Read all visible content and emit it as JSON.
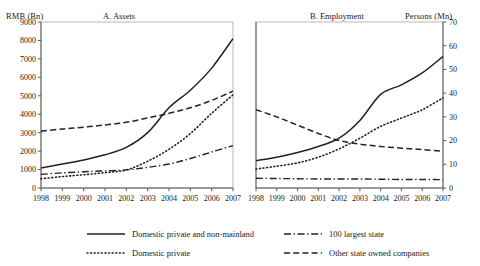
{
  "figure": {
    "background": "#ffffff",
    "line_color": "#222222"
  },
  "panels": [
    {
      "id": "assets",
      "title": "A. Assets",
      "unit_label": "RMB (Bn)",
      "unit_position": "left"
    },
    {
      "id": "employment",
      "title": "B. Employment",
      "unit_label": "Persons (Mn)",
      "unit_position": "right"
    }
  ],
  "legend": {
    "items": [
      {
        "label": "Domestic private and non-mainland",
        "style": "solid"
      },
      {
        "label": "Domestic private",
        "style": "dotted"
      },
      {
        "label": "100 largest state",
        "style": "dashdot"
      },
      {
        "label": "Other state owned companies",
        "style": "dashed"
      }
    ]
  },
  "chart_data": [
    {
      "type": "line",
      "title": "A. Assets",
      "xlabel": "",
      "ylabel": "RMB (Bn)",
      "grid": false,
      "legend_position": "below-figure",
      "x": [
        1998,
        1999,
        2000,
        2001,
        2002,
        2003,
        2004,
        2005,
        2006,
        2007
      ],
      "xtick_labels": [
        "1998",
        "1999",
        "2000",
        "2001",
        "2002",
        "2003",
        "2004",
        "2005",
        "2006",
        "2007"
      ],
      "ylim": [
        0,
        9000
      ],
      "ytick_labels": [
        "0",
        "1000",
        "2000",
        "3000",
        "4000",
        "5000",
        "6000",
        "7000",
        "8000",
        "9000"
      ],
      "yticks": [
        0,
        1000,
        2000,
        3000,
        4000,
        5000,
        6000,
        7000,
        8000,
        9000
      ],
      "series": [
        {
          "name": "Domestic private and non-mainland",
          "style": "solid",
          "values": [
            1080,
            1300,
            1520,
            1800,
            2200,
            3000,
            4350,
            5300,
            6500,
            8100
          ]
        },
        {
          "name": "Domestic private",
          "style": "dotted",
          "values": [
            500,
            620,
            720,
            830,
            980,
            1450,
            2100,
            2950,
            4050,
            5050
          ]
        },
        {
          "name": "100 largest state",
          "style": "dashdot",
          "values": [
            740,
            820,
            880,
            930,
            980,
            1120,
            1300,
            1600,
            1950,
            2300
          ]
        },
        {
          "name": "Other state owned companies",
          "style": "dashed",
          "values": [
            3080,
            3200,
            3300,
            3420,
            3560,
            3800,
            4050,
            4350,
            4750,
            5250
          ]
        }
      ]
    },
    {
      "type": "line",
      "title": "B. Employment",
      "xlabel": "",
      "ylabel": "Persons (Mn)",
      "grid": false,
      "legend_position": "below-figure",
      "x": [
        1998,
        1999,
        2000,
        2001,
        2002,
        2003,
        2004,
        2005,
        2006,
        2007
      ],
      "xtick_labels": [
        "1998",
        "1999",
        "2000",
        "2001",
        "2002",
        "2003",
        "2004",
        "2005",
        "2006",
        "2007"
      ],
      "ylim": [
        0,
        70
      ],
      "ytick_labels": [
        "0",
        "10",
        "20",
        "30",
        "40",
        "50",
        "60",
        "70"
      ],
      "yticks": [
        0,
        10,
        20,
        30,
        40,
        50,
        60,
        70
      ],
      "series": [
        {
          "name": "Domestic private and non-mainland",
          "style": "solid",
          "values": [
            11.5,
            13.0,
            15.0,
            17.5,
            21.0,
            28.5,
            39.5,
            43.5,
            48.5,
            55.5
          ]
        },
        {
          "name": "Domestic private",
          "style": "dotted",
          "values": [
            8.0,
            9.2,
            10.6,
            13.0,
            16.5,
            21.0,
            26.0,
            29.5,
            33.0,
            38.0
          ]
        },
        {
          "name": "100 largest state",
          "style": "dashdot",
          "values": [
            4.1,
            4.0,
            3.9,
            3.8,
            3.8,
            3.8,
            3.7,
            3.6,
            3.6,
            3.5
          ]
        },
        {
          "name": "Other state owned companies",
          "style": "dashed",
          "values": [
            33.0,
            30.0,
            26.5,
            23.0,
            20.0,
            18.5,
            17.5,
            16.8,
            16.2,
            15.5
          ]
        }
      ]
    }
  ]
}
